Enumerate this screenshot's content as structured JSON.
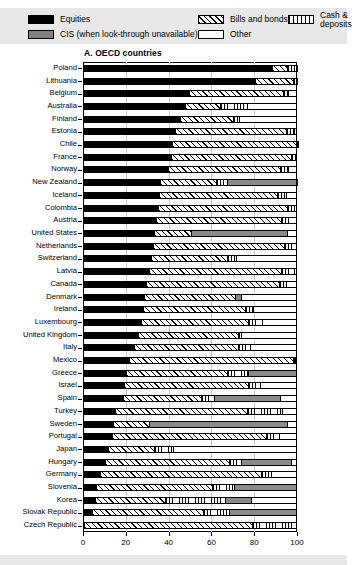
{
  "legend": {
    "items": [
      {
        "label": "Equities",
        "key": "equities",
        "color": "#000000"
      },
      {
        "label": "CIS (when look-through unavailable)",
        "key": "cis",
        "color": "#808080"
      },
      {
        "label": "Bills and bonds",
        "key": "bills",
        "color": "#ffffff"
      },
      {
        "label": "Other",
        "key": "other",
        "color": "#ffffff"
      },
      {
        "label": "Cash & deposits",
        "key": "cash",
        "color": "#ffffff"
      }
    ]
  },
  "chart_data": {
    "type": "bar",
    "orientation": "horizontal",
    "stacked": true,
    "title": "A. OECD countries",
    "xlabel": "",
    "ylabel": "",
    "xlim": [
      0,
      100
    ],
    "xticks": [
      0,
      20,
      40,
      60,
      80,
      100
    ],
    "xtick_labels": [
      "0",
      "20",
      "40",
      "60",
      "80",
      "100"
    ],
    "grid": true,
    "legend_position": "top",
    "series": [
      {
        "name": "Equities",
        "key": "equities"
      },
      {
        "name": "Bills and bonds",
        "key": "bills"
      },
      {
        "name": "Cash & deposits",
        "key": "cash"
      },
      {
        "name": "CIS (when look-through unavailable)",
        "key": "cis"
      },
      {
        "name": "Other",
        "key": "other"
      }
    ],
    "categories": [
      "Poland",
      "Lithuania",
      "Belgium",
      "Australia",
      "Finland",
      "Estonia",
      "Chile",
      "France",
      "Norway",
      "New Zealand",
      "Iceland",
      "Colombia",
      "Austria",
      "United States",
      "Netherlands",
      "Switzerland",
      "Latvia",
      "Canada",
      "Denmark",
      "Ireland",
      "Luxembourg",
      "United Kingdom",
      "Italy",
      "Mexico",
      "Greece",
      "Israel",
      "Spain",
      "Turkey",
      "Sweden",
      "Portugal",
      "Japan",
      "Hungary",
      "Germany",
      "Slovenia",
      "Korea",
      "Slovak Republic",
      "Czech Republic"
    ],
    "rows": [
      {
        "country": "Poland",
        "segments": [
          {
            "key": "equities",
            "value": 88.5
          },
          {
            "key": "bills",
            "value": 7.0
          },
          {
            "key": "cash",
            "value": 4.0
          },
          {
            "key": "other",
            "value": 0.5
          }
        ]
      },
      {
        "country": "Lithuania",
        "segments": [
          {
            "key": "equities",
            "value": 80.5
          },
          {
            "key": "bills",
            "value": 17.5
          },
          {
            "key": "cash",
            "value": 1.5
          },
          {
            "key": "other",
            "value": 0.5
          }
        ]
      },
      {
        "country": "Belgium",
        "segments": [
          {
            "key": "equities",
            "value": 49.5
          },
          {
            "key": "bills",
            "value": 44.0
          },
          {
            "key": "cash",
            "value": 2.5
          },
          {
            "key": "other",
            "value": 4.0
          }
        ]
      },
      {
        "country": "Australia",
        "segments": [
          {
            "key": "equities",
            "value": 47.5
          },
          {
            "key": "bills",
            "value": 16.5
          },
          {
            "key": "cash",
            "value": 12.5
          },
          {
            "key": "other",
            "value": 23.5
          }
        ]
      },
      {
        "country": "Finland",
        "segments": [
          {
            "key": "equities",
            "value": 45.5
          },
          {
            "key": "bills",
            "value": 24.5
          },
          {
            "key": "cash",
            "value": 3.0
          },
          {
            "key": "other",
            "value": 27.0
          }
        ]
      },
      {
        "country": "Estonia",
        "segments": [
          {
            "key": "equities",
            "value": 43.0
          },
          {
            "key": "bills",
            "value": 52.0
          },
          {
            "key": "cash",
            "value": 3.5
          },
          {
            "key": "other",
            "value": 1.5
          }
        ]
      },
      {
        "country": "Chile",
        "segments": [
          {
            "key": "equities",
            "value": 41.5
          },
          {
            "key": "bills",
            "value": 58.0
          },
          {
            "key": "cash",
            "value": 0.5
          },
          {
            "key": "other",
            "value": 0.0
          }
        ]
      },
      {
        "country": "France",
        "segments": [
          {
            "key": "equities",
            "value": 41.0
          },
          {
            "key": "bills",
            "value": 56.0
          },
          {
            "key": "cash",
            "value": 2.0
          },
          {
            "key": "other",
            "value": 1.0
          }
        ]
      },
      {
        "country": "Norway",
        "segments": [
          {
            "key": "equities",
            "value": 39.5
          },
          {
            "key": "bills",
            "value": 52.5
          },
          {
            "key": "cash",
            "value": 4.0
          },
          {
            "key": "other",
            "value": 4.0
          }
        ]
      },
      {
        "country": "New Zealand",
        "segments": [
          {
            "key": "equities",
            "value": 36.0
          },
          {
            "key": "bills",
            "value": 26.0
          },
          {
            "key": "cash",
            "value": 5.5
          },
          {
            "key": "cis",
            "value": 32.0
          },
          {
            "key": "other",
            "value": 0.5
          }
        ]
      },
      {
        "country": "Iceland",
        "segments": [
          {
            "key": "equities",
            "value": 35.5
          },
          {
            "key": "bills",
            "value": 55.0
          },
          {
            "key": "cash",
            "value": 4.5
          },
          {
            "key": "other",
            "value": 5.0
          }
        ]
      },
      {
        "country": "Colombia",
        "segments": [
          {
            "key": "equities",
            "value": 35.0
          },
          {
            "key": "bills",
            "value": 60.5
          },
          {
            "key": "cash",
            "value": 3.0
          },
          {
            "key": "other",
            "value": 1.5
          }
        ]
      },
      {
        "country": "Austria",
        "segments": [
          {
            "key": "equities",
            "value": 34.0
          },
          {
            "key": "bills",
            "value": 58.5
          },
          {
            "key": "cash",
            "value": 3.5
          },
          {
            "key": "other",
            "value": 4.0
          }
        ]
      },
      {
        "country": "United States",
        "segments": [
          {
            "key": "equities",
            "value": 33.0
          },
          {
            "key": "bills",
            "value": 17.5
          },
          {
            "key": "cis",
            "value": 45.0
          },
          {
            "key": "other",
            "value": 4.5
          }
        ]
      },
      {
        "country": "Netherlands",
        "segments": [
          {
            "key": "equities",
            "value": 32.5
          },
          {
            "key": "bills",
            "value": 61.5
          },
          {
            "key": "cash",
            "value": 3.0
          },
          {
            "key": "other",
            "value": 3.0
          }
        ]
      },
      {
        "country": "Switzerland",
        "segments": [
          {
            "key": "equities",
            "value": 32.0
          },
          {
            "key": "bills",
            "value": 35.5
          },
          {
            "key": "cash",
            "value": 4.0
          },
          {
            "key": "other",
            "value": 28.5
          }
        ]
      },
      {
        "country": "Latvia",
        "segments": [
          {
            "key": "equities",
            "value": 31.0
          },
          {
            "key": "bills",
            "value": 61.5
          },
          {
            "key": "cash",
            "value": 6.0
          },
          {
            "key": "other",
            "value": 1.5
          }
        ]
      },
      {
        "country": "Canada",
        "segments": [
          {
            "key": "equities",
            "value": 29.5
          },
          {
            "key": "bills",
            "value": 62.0
          },
          {
            "key": "cash",
            "value": 3.5
          },
          {
            "key": "other",
            "value": 5.0
          }
        ]
      },
      {
        "country": "Denmark",
        "segments": [
          {
            "key": "equities",
            "value": 28.5
          },
          {
            "key": "bills",
            "value": 42.5
          },
          {
            "key": "cis",
            "value": 3.0
          },
          {
            "key": "other",
            "value": 26.0
          }
        ]
      },
      {
        "country": "Ireland",
        "segments": [
          {
            "key": "equities",
            "value": 28.0
          },
          {
            "key": "bills",
            "value": 47.5
          },
          {
            "key": "cash",
            "value": 4.0
          },
          {
            "key": "other",
            "value": 20.5
          }
        ]
      },
      {
        "country": "Luxembourg",
        "segments": [
          {
            "key": "equities",
            "value": 27.0
          },
          {
            "key": "bills",
            "value": 50.0
          },
          {
            "key": "cash",
            "value": 6.5
          },
          {
            "key": "other",
            "value": 16.5
          }
        ]
      },
      {
        "country": "United Kingdom",
        "segments": [
          {
            "key": "equities",
            "value": 25.5
          },
          {
            "key": "bills",
            "value": 47.0
          },
          {
            "key": "cash",
            "value": 1.5
          },
          {
            "key": "other",
            "value": 26.0
          }
        ]
      },
      {
        "country": "Italy",
        "segments": [
          {
            "key": "equities",
            "value": 24.0
          },
          {
            "key": "bills",
            "value": 48.5
          },
          {
            "key": "cash",
            "value": 5.5
          },
          {
            "key": "other",
            "value": 22.0
          }
        ]
      },
      {
        "country": "Mexico",
        "segments": [
          {
            "key": "equities",
            "value": 21.5
          },
          {
            "key": "bills",
            "value": 76.5
          },
          {
            "key": "cash",
            "value": 1.0
          },
          {
            "key": "other",
            "value": 1.0
          }
        ]
      },
      {
        "country": "Greece",
        "segments": [
          {
            "key": "equities",
            "value": 20.0
          },
          {
            "key": "bills",
            "value": 47.5
          },
          {
            "key": "cash",
            "value": 9.5
          },
          {
            "key": "cis",
            "value": 23.0
          }
        ]
      },
      {
        "country": "Israel",
        "segments": [
          {
            "key": "equities",
            "value": 19.0
          },
          {
            "key": "bills",
            "value": 58.0
          },
          {
            "key": "cash",
            "value": 5.5
          },
          {
            "key": "other",
            "value": 17.5
          }
        ]
      },
      {
        "country": "Spain",
        "segments": [
          {
            "key": "equities",
            "value": 18.5
          },
          {
            "key": "bills",
            "value": 36.5
          },
          {
            "key": "cash",
            "value": 6.0
          },
          {
            "key": "cis",
            "value": 31.0
          },
          {
            "key": "other",
            "value": 8.0
          }
        ]
      },
      {
        "country": "Turkey",
        "segments": [
          {
            "key": "equities",
            "value": 15.0
          },
          {
            "key": "bills",
            "value": 61.5
          },
          {
            "key": "cash",
            "value": 16.5
          },
          {
            "key": "other",
            "value": 7.0
          }
        ]
      },
      {
        "country": "Sweden",
        "segments": [
          {
            "key": "equities",
            "value": 14.0
          },
          {
            "key": "bills",
            "value": 17.0
          },
          {
            "key": "cis",
            "value": 64.5
          },
          {
            "key": "other",
            "value": 4.5
          }
        ]
      },
      {
        "country": "Portugal",
        "segments": [
          {
            "key": "equities",
            "value": 13.5
          },
          {
            "key": "bills",
            "value": 72.0
          },
          {
            "key": "cash",
            "value": 6.0
          },
          {
            "key": "other",
            "value": 8.5
          }
        ]
      },
      {
        "country": "Japan",
        "segments": [
          {
            "key": "equities",
            "value": 11.5
          },
          {
            "key": "bills",
            "value": 21.5
          },
          {
            "key": "cash",
            "value": 9.0
          },
          {
            "key": "other",
            "value": 58.0
          }
        ]
      },
      {
        "country": "Hungary",
        "segments": [
          {
            "key": "equities",
            "value": 10.5
          },
          {
            "key": "bills",
            "value": 57.5
          },
          {
            "key": "cash",
            "value": 6.0
          },
          {
            "key": "cis",
            "value": 23.0
          },
          {
            "key": "other",
            "value": 3.0
          }
        ]
      },
      {
        "country": "Germany",
        "segments": [
          {
            "key": "equities",
            "value": 8.0
          },
          {
            "key": "bills",
            "value": 75.0
          },
          {
            "key": "cash",
            "value": 5.0
          },
          {
            "key": "other",
            "value": 12.0
          }
        ]
      },
      {
        "country": "Slovenia",
        "segments": [
          {
            "key": "equities",
            "value": 6.0
          },
          {
            "key": "bills",
            "value": 54.5
          },
          {
            "key": "cash",
            "value": 10.0
          },
          {
            "key": "cis",
            "value": 29.5
          }
        ]
      },
      {
        "country": "Korea",
        "segments": [
          {
            "key": "equities",
            "value": 5.5
          },
          {
            "key": "bills",
            "value": 33.0
          },
          {
            "key": "cash",
            "value": 28.0
          },
          {
            "key": "cis",
            "value": 12.0
          },
          {
            "key": "other",
            "value": 21.5
          }
        ]
      },
      {
        "country": "Slovak Republic",
        "segments": [
          {
            "key": "equities",
            "value": 4.0
          },
          {
            "key": "bills",
            "value": 52.0
          },
          {
            "key": "cash",
            "value": 12.0
          },
          {
            "key": "cis",
            "value": 32.0
          }
        ]
      },
      {
        "country": "Czech Republic",
        "segments": [
          {
            "key": "equities",
            "value": 0.5
          },
          {
            "key": "bills",
            "value": 78.5
          },
          {
            "key": "cash",
            "value": 21.0
          }
        ]
      }
    ]
  }
}
